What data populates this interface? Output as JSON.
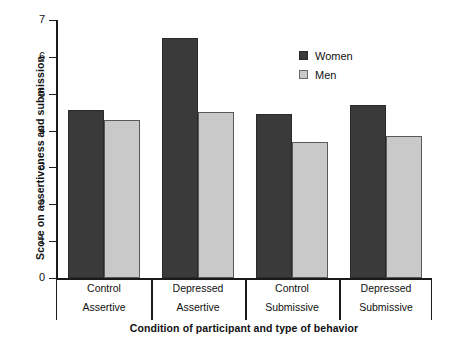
{
  "chart_data": {
    "type": "bar",
    "title": "",
    "xlabel": "Condition of participant and type of behavior",
    "ylabel": "Score on assertiveness and submission",
    "ylim": [
      0,
      7
    ],
    "ytick_labels": [
      "7",
      "6",
      "5",
      "4",
      "3",
      "2",
      "1",
      "0"
    ],
    "ytick_values": [
      7,
      6,
      5,
      4,
      3,
      2,
      1,
      0
    ],
    "grid": false,
    "legend_position": "upper-right-inside",
    "categories": [
      {
        "line1": "Control",
        "line2": "Assertive"
      },
      {
        "line1": "Depressed",
        "line2": "Assertive"
      },
      {
        "line1": "Control",
        "line2": "Submissive"
      },
      {
        "line1": "Depressed",
        "line2": "Submissive"
      }
    ],
    "category_labels": [
      "Control Assertive",
      "Depressed Assertive",
      "Control Submissive",
      "Depressed Submissive"
    ],
    "series": [
      {
        "name": "Women",
        "color": "#3a3a3a",
        "values": [
          4.55,
          6.5,
          4.45,
          4.7
        ]
      },
      {
        "name": "Men",
        "color": "#c9c9c9",
        "values": [
          4.3,
          4.5,
          3.7,
          3.85
        ]
      }
    ]
  },
  "legend": {
    "items": [
      {
        "label": "Women",
        "swatch": "women"
      },
      {
        "label": "Men",
        "swatch": "men"
      }
    ]
  },
  "colors": {
    "women_bar": "#3a3a3a",
    "men_bar": "#c9c9c9",
    "axis": "#1a1a1a",
    "background": "#ffffff"
  }
}
